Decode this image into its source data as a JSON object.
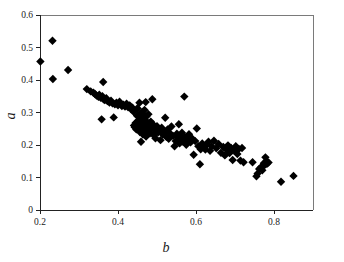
{
  "chart_data": {
    "type": "scatter",
    "title": "",
    "xlabel": "b",
    "ylabel": "a",
    "xlim": [
      0.2,
      0.9
    ],
    "ylim": [
      0.0,
      0.6
    ],
    "xticks": [
      0.2,
      0.4,
      0.6,
      0.8
    ],
    "yticks": [
      0.0,
      0.1,
      0.2,
      0.3,
      0.4,
      0.5,
      0.6
    ],
    "xtick_labels": [
      "0.2",
      "0.4",
      "0.6",
      "0.8"
    ],
    "ytick_labels": [
      "0",
      "0.1",
      "0.2",
      "0.3",
      "0.4",
      "0.5",
      "0.6"
    ],
    "grid": false,
    "legend": null,
    "marker": "diamond",
    "marker_color": "#000000",
    "marker_size": 4.2,
    "series": [
      {
        "name": "observations",
        "points": [
          [
            0.201,
            0.457
          ],
          [
            0.232,
            0.521
          ],
          [
            0.233,
            0.403
          ],
          [
            0.272,
            0.431
          ],
          [
            0.32,
            0.372
          ],
          [
            0.33,
            0.365
          ],
          [
            0.337,
            0.361
          ],
          [
            0.341,
            0.357
          ],
          [
            0.345,
            0.352
          ],
          [
            0.35,
            0.348
          ],
          [
            0.352,
            0.355
          ],
          [
            0.356,
            0.345
          ],
          [
            0.36,
            0.35
          ],
          [
            0.362,
            0.394
          ],
          [
            0.363,
            0.341
          ],
          [
            0.358,
            0.279
          ],
          [
            0.366,
            0.338
          ],
          [
            0.37,
            0.344
          ],
          [
            0.373,
            0.335
          ],
          [
            0.378,
            0.331
          ],
          [
            0.382,
            0.336
          ],
          [
            0.386,
            0.328
          ],
          [
            0.389,
            0.285
          ],
          [
            0.392,
            0.325
          ],
          [
            0.396,
            0.33
          ],
          [
            0.4,
            0.322
          ],
          [
            0.404,
            0.333
          ],
          [
            0.407,
            0.326
          ],
          [
            0.41,
            0.32
          ],
          [
            0.414,
            0.324
          ],
          [
            0.418,
            0.318
          ],
          [
            0.422,
            0.327
          ],
          [
            0.426,
            0.316
          ],
          [
            0.43,
            0.322
          ],
          [
            0.434,
            0.31
          ],
          [
            0.437,
            0.315
          ],
          [
            0.44,
            0.302
          ],
          [
            0.441,
            0.26
          ],
          [
            0.443,
            0.255
          ],
          [
            0.445,
            0.268
          ],
          [
            0.447,
            0.248
          ],
          [
            0.449,
            0.29
          ],
          [
            0.45,
            0.313
          ],
          [
            0.452,
            0.275
          ],
          [
            0.454,
            0.258
          ],
          [
            0.455,
            0.33
          ],
          [
            0.456,
            0.24
          ],
          [
            0.457,
            0.297
          ],
          [
            0.458,
            0.265
          ],
          [
            0.459,
            0.21
          ],
          [
            0.46,
            0.285
          ],
          [
            0.461,
            0.25
          ],
          [
            0.462,
            0.302
          ],
          [
            0.463,
            0.272
          ],
          [
            0.464,
            0.232
          ],
          [
            0.465,
            0.292
          ],
          [
            0.466,
            0.261
          ],
          [
            0.467,
            0.245
          ],
          [
            0.468,
            0.308
          ],
          [
            0.469,
            0.278
          ],
          [
            0.47,
            0.255
          ],
          [
            0.471,
            0.332
          ],
          [
            0.472,
            0.226
          ],
          [
            0.473,
            0.288
          ],
          [
            0.474,
            0.267
          ],
          [
            0.476,
            0.243
          ],
          [
            0.478,
            0.295
          ],
          [
            0.48,
            0.258
          ],
          [
            0.482,
            0.236
          ],
          [
            0.484,
            0.272
          ],
          [
            0.486,
            0.249
          ],
          [
            0.488,
            0.341
          ],
          [
            0.49,
            0.263
          ],
          [
            0.492,
            0.23
          ],
          [
            0.494,
            0.251
          ],
          [
            0.496,
            0.221
          ],
          [
            0.498,
            0.244
          ],
          [
            0.5,
            0.258
          ],
          [
            0.503,
            0.239
          ],
          [
            0.506,
            0.247
          ],
          [
            0.509,
            0.215
          ],
          [
            0.512,
            0.253
          ],
          [
            0.515,
            0.232
          ],
          [
            0.518,
            0.241
          ],
          [
            0.521,
            0.284
          ],
          [
            0.524,
            0.225
          ],
          [
            0.527,
            0.248
          ],
          [
            0.53,
            0.219
          ],
          [
            0.533,
            0.236
          ],
          [
            0.537,
            0.257
          ],
          [
            0.541,
            0.228
          ],
          [
            0.545,
            0.196
          ],
          [
            0.548,
            0.212
          ],
          [
            0.551,
            0.235
          ],
          [
            0.554,
            0.222
          ],
          [
            0.556,
            0.264
          ],
          [
            0.558,
            0.205
          ],
          [
            0.56,
            0.228
          ],
          [
            0.562,
            0.218
          ],
          [
            0.564,
            0.238
          ],
          [
            0.567,
            0.21
          ],
          [
            0.57,
            0.349
          ],
          [
            0.572,
            0.224
          ],
          [
            0.575,
            0.201
          ],
          [
            0.578,
            0.216
          ],
          [
            0.582,
            0.233
          ],
          [
            0.586,
            0.208
          ],
          [
            0.59,
            0.22
          ],
          [
            0.594,
            0.17
          ],
          [
            0.598,
            0.212
          ],
          [
            0.602,
            0.251
          ],
          [
            0.606,
            0.196
          ],
          [
            0.61,
            0.141
          ],
          [
            0.612,
            0.187
          ],
          [
            0.616,
            0.205
          ],
          [
            0.62,
            0.193
          ],
          [
            0.624,
            0.186
          ],
          [
            0.628,
            0.201
          ],
          [
            0.632,
            0.21
          ],
          [
            0.636,
            0.182
          ],
          [
            0.64,
            0.196
          ],
          [
            0.646,
            0.213
          ],
          [
            0.652,
            0.19
          ],
          [
            0.658,
            0.203
          ],
          [
            0.664,
            0.176
          ],
          [
            0.67,
            0.194
          ],
          [
            0.674,
            0.168
          ],
          [
            0.678,
            0.186
          ],
          [
            0.682,
            0.199
          ],
          [
            0.686,
            0.175
          ],
          [
            0.69,
            0.191
          ],
          [
            0.694,
            0.154
          ],
          [
            0.698,
            0.183
          ],
          [
            0.702,
            0.196
          ],
          [
            0.706,
            0.172
          ],
          [
            0.71,
            0.188
          ],
          [
            0.714,
            0.152
          ],
          [
            0.718,
            0.191
          ],
          [
            0.722,
            0.147
          ],
          [
            0.745,
            0.147
          ],
          [
            0.755,
            0.104
          ],
          [
            0.758,
            0.112
          ],
          [
            0.762,
            0.126
          ],
          [
            0.766,
            0.131
          ],
          [
            0.77,
            0.122
          ],
          [
            0.774,
            0.144
          ],
          [
            0.776,
            0.138
          ],
          [
            0.778,
            0.162
          ],
          [
            0.78,
            0.149
          ],
          [
            0.782,
            0.142
          ],
          [
            0.786,
            0.146
          ],
          [
            0.818,
            0.087
          ],
          [
            0.85,
            0.105
          ]
        ]
      }
    ]
  },
  "axes": {
    "x_title": "b",
    "y_title": "a"
  }
}
